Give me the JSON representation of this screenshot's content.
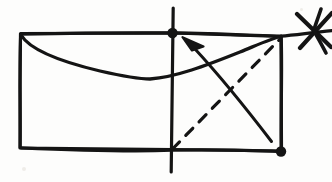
{
  "page": {
    "background_color": "#fdfdfc",
    "ink_color": "#141414",
    "width": 332,
    "height": 182
  },
  "figure": {
    "caption": "",
    "elements": [
      {
        "id": "rectangle-outline",
        "name": "rectangle-outline",
        "kind": "polygon",
        "stroke": "solid",
        "stroke_color": "#141414",
        "stroke_width": 3,
        "points": [
          [
            20,
            34
          ],
          [
            281,
            36
          ],
          [
            281,
            151
          ],
          [
            20,
            148
          ]
        ]
      },
      {
        "id": "top-edge-extension",
        "name": "top-edge-extension",
        "kind": "line",
        "stroke": "solid",
        "stroke_color": "#141414",
        "stroke_width": 3,
        "from": [
          281,
          36
        ],
        "to": [
          332,
          31
        ]
      },
      {
        "id": "curved-crease",
        "name": "curved-crease-line",
        "kind": "curve",
        "stroke": "solid",
        "stroke_color": "#141414",
        "stroke_width": 3,
        "from": [
          21,
          36
        ],
        "sag_point": [
          148,
          79
        ],
        "to": [
          281,
          37
        ]
      },
      {
        "id": "vertical-axis",
        "name": "vertical-axis-line",
        "kind": "line",
        "stroke": "solid",
        "stroke_color": "#141414",
        "stroke_width": 3,
        "from": [
          173,
          8
        ],
        "to": [
          171,
          172
        ]
      },
      {
        "id": "solid-arrow",
        "name": "fold-direction-arrow",
        "kind": "arrow",
        "stroke": "solid",
        "stroke_color": "#141414",
        "stroke_width": 3,
        "from": [
          271,
          141
        ],
        "to": [
          184,
          39
        ],
        "arrowhead": "open-triangle",
        "arrowhead_at": "to"
      },
      {
        "id": "dashed-diagonal",
        "name": "dashed-fold-line",
        "kind": "line",
        "stroke": "dashed",
        "stroke_color": "#141414",
        "stroke_width": 3,
        "dash_pattern": [
          9,
          8
        ],
        "from": [
          172,
          150
        ],
        "to": [
          280,
          40
        ]
      },
      {
        "id": "dot-top",
        "name": "vertex-dot-top",
        "kind": "dot",
        "fill": "#141414",
        "center": [
          172,
          33
        ],
        "radius": 5
      },
      {
        "id": "dot-bottom-right",
        "name": "vertex-dot-bottom-right",
        "kind": "dot",
        "fill": "#141414",
        "center": [
          281,
          152
        ],
        "radius": 5
      },
      {
        "id": "x-mark",
        "name": "x-cross-mark",
        "kind": "cross",
        "stroke": "solid",
        "stroke_color": "#141414",
        "stroke_width": 4,
        "center": [
          314,
          31
        ],
        "strokes": [
          [
            [
              298,
              13
            ],
            [
              332,
              48
            ]
          ],
          [
            [
              332,
              12
            ],
            [
              300,
              49
            ]
          ],
          [
            [
              322,
              10
            ],
            [
              314,
              31
            ]
          ],
          [
            [
              314,
              31
            ],
            [
              326,
              52
            ]
          ]
        ]
      }
    ]
  },
  "labels": {
    "none_visible": ""
  }
}
